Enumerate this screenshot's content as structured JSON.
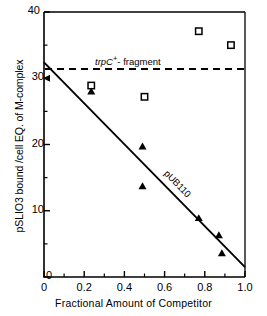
{
  "chart_data": {
    "type": "scatter",
    "title": "",
    "xlabel": "Fractional Amount of Competitor",
    "ylabel": "pSLIO3 bound /cell EQ. of M-complex",
    "xlim": [
      0,
      1.0
    ],
    "ylim": [
      0,
      40
    ],
    "xticks": [
      "0",
      "0.2",
      "0.4",
      "0.6",
      "0.8",
      "1.0"
    ],
    "xtick_values": [
      0,
      0.2,
      0.4,
      0.6,
      0.8,
      1.0
    ],
    "xminor_values": [
      0.1,
      0.3,
      0.5,
      0.7,
      0.9
    ],
    "yticks": [
      "0",
      "10",
      "20",
      "30",
      "40"
    ],
    "ytick_values": [
      0,
      10,
      20,
      30,
      40
    ],
    "grid": false,
    "legend": "none",
    "series": [
      {
        "name": "open-square",
        "marker": "open-square",
        "points": [
          {
            "x": 0.235,
            "y": 28.9
          },
          {
            "x": 0.5,
            "y": 27.2
          },
          {
            "x": 0.77,
            "y": 37.1
          },
          {
            "x": 0.93,
            "y": 35.0
          }
        ]
      },
      {
        "name": "filled-triangle",
        "marker": "filled-triangle",
        "points": [
          {
            "x": 0.235,
            "y": 28.0
          },
          {
            "x": 0.49,
            "y": 19.7
          },
          {
            "x": 0.49,
            "y": 13.7
          },
          {
            "x": 0.77,
            "y": 8.9
          },
          {
            "x": 0.87,
            "y": 6.3
          },
          {
            "x": 0.885,
            "y": 3.6
          }
        ]
      }
    ],
    "fit_line": {
      "label": "pUB110",
      "x0": 0.0,
      "y0": 32.4,
      "x1": 1.0,
      "y1": 1.5
    },
    "reference_line": {
      "label_prefix": "trpC",
      "label_sup": "+",
      "label_suffix": "- fragment",
      "style": "dashed",
      "y": 31.4
    },
    "axis_tick_marker": {
      "y": 30,
      "marker": "left-arrow"
    }
  },
  "axis": {
    "x_label": "Fractional Amount of Competitor",
    "y_label": "pSLIO3 bound /cell EQ. of M-complex"
  },
  "colors": {
    "axis": "#000000",
    "data": "#000000",
    "background": "#ffffff"
  }
}
